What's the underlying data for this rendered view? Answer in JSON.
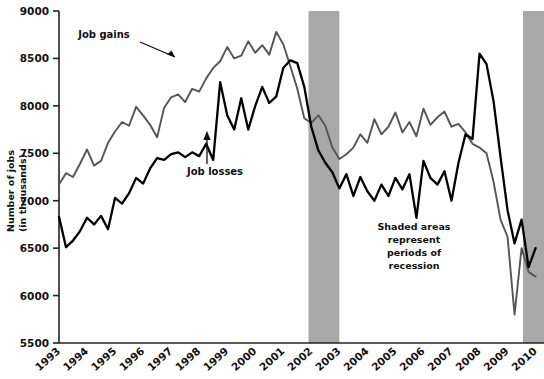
{
  "chart_data": {
    "type": "line",
    "title": "",
    "xlabel": "",
    "ylabel": "Number of jobs\n(in thousands)",
    "ylabel_line1": "Number of jobs",
    "ylabel_line2": "(in thousands)",
    "ylim": [
      5500,
      9000
    ],
    "yticks": [
      5500,
      6000,
      6500,
      7000,
      7500,
      8000,
      8500,
      9000
    ],
    "ytick_labels": [
      "5500",
      "6000",
      "6500",
      "7000",
      "7500",
      "8000",
      "8500",
      "9000"
    ],
    "xlim": [
      1993,
      2010.3
    ],
    "xticks": [
      1993,
      1994,
      1995,
      1996,
      1997,
      1998,
      1999,
      2000,
      2001,
      2002,
      2003,
      2004,
      2005,
      2006,
      2007,
      2008,
      2009,
      2010
    ],
    "xtick_labels": [
      "1993",
      "1994",
      "1995",
      "1996",
      "1997",
      "1998",
      "1999",
      "2000",
      "2001",
      "2002",
      "2003",
      "2004",
      "2005",
      "2006",
      "2007",
      "2008",
      "2009",
      "2010"
    ],
    "grid": false,
    "legend_position": "inline-annotations",
    "series": [
      {
        "name": "Job gains",
        "color": "#555555",
        "label_text": "Job gains",
        "annotation_kind": "arrow-to-line",
        "x": [
          1993.0,
          1993.25,
          1993.5,
          1993.75,
          1994.0,
          1994.25,
          1994.5,
          1994.75,
          1995.0,
          1995.25,
          1995.5,
          1995.75,
          1996.0,
          1996.25,
          1996.5,
          1996.75,
          1997.0,
          1997.25,
          1997.5,
          1997.75,
          1998.0,
          1998.25,
          1998.5,
          1998.75,
          1999.0,
          1999.25,
          1999.5,
          1999.75,
          2000.0,
          2000.25,
          2000.5,
          2000.75,
          2001.0,
          2001.25,
          2001.5,
          2001.75,
          2002.0,
          2002.25,
          2002.5,
          2002.75,
          2003.0,
          2003.25,
          2003.5,
          2003.75,
          2004.0,
          2004.25,
          2004.5,
          2004.75,
          2005.0,
          2005.25,
          2005.5,
          2005.75,
          2006.0,
          2006.25,
          2006.5,
          2006.75,
          2007.0,
          2007.25,
          2007.5,
          2007.75,
          2008.0,
          2008.25,
          2008.5,
          2008.75,
          2009.0,
          2009.25,
          2009.5,
          2009.75,
          2010.0
        ],
        "values": [
          7170,
          7290,
          7250,
          7390,
          7540,
          7370,
          7420,
          7610,
          7730,
          7830,
          7790,
          7990,
          7900,
          7800,
          7670,
          7980,
          8090,
          8120,
          8040,
          8180,
          8150,
          8290,
          8400,
          8470,
          8620,
          8500,
          8530,
          8680,
          8560,
          8640,
          8540,
          8780,
          8650,
          8420,
          8180,
          7870,
          7820,
          7900,
          7790,
          7560,
          7440,
          7490,
          7560,
          7700,
          7610,
          7860,
          7700,
          7780,
          7930,
          7720,
          7830,
          7680,
          7970,
          7800,
          7880,
          7940,
          7780,
          7810,
          7720,
          7600,
          7560,
          7500,
          7200,
          6800,
          6620,
          5800,
          6500,
          6250,
          6200
        ],
        "annotation_description": "Gray line labeled 'Job gains' with arrow pointing to the line near 1995"
      },
      {
        "name": "Job losses",
        "color": "#000000",
        "label_text": "Job losses",
        "annotation_kind": "arrow-to-line",
        "x": [
          1993.0,
          1993.25,
          1993.5,
          1993.75,
          1994.0,
          1994.25,
          1994.5,
          1994.75,
          1995.0,
          1995.25,
          1995.5,
          1995.75,
          1996.0,
          1996.25,
          1996.5,
          1996.75,
          1997.0,
          1997.25,
          1997.5,
          1997.75,
          1998.0,
          1998.25,
          1998.5,
          1998.75,
          1999.0,
          1999.25,
          1999.5,
          1999.75,
          2000.0,
          2000.25,
          2000.5,
          2000.75,
          2001.0,
          2001.25,
          2001.5,
          2001.75,
          2002.0,
          2002.25,
          2002.5,
          2002.75,
          2003.0,
          2003.25,
          2003.5,
          2003.75,
          2004.0,
          2004.25,
          2004.5,
          2004.75,
          2005.0,
          2005.25,
          2005.5,
          2005.75,
          2006.0,
          2006.25,
          2006.5,
          2006.75,
          2007.0,
          2007.25,
          2007.5,
          2007.75,
          2008.0,
          2008.25,
          2008.5,
          2008.75,
          2009.0,
          2009.25,
          2009.5,
          2009.75,
          2010.0
        ],
        "values": [
          6830,
          6510,
          6580,
          6680,
          6820,
          6750,
          6840,
          6700,
          7030,
          6970,
          7080,
          7240,
          7180,
          7340,
          7450,
          7430,
          7490,
          7510,
          7460,
          7510,
          7470,
          7600,
          7430,
          8250,
          7900,
          7750,
          8080,
          7750,
          8000,
          8200,
          8030,
          8100,
          8400,
          8480,
          8450,
          8200,
          7780,
          7530,
          7400,
          7300,
          7130,
          7280,
          7050,
          7250,
          7100,
          7000,
          7170,
          7050,
          7240,
          7120,
          7280,
          6820,
          7420,
          7240,
          7170,
          7310,
          7000,
          7400,
          7700,
          7650,
          8550,
          8440,
          8050,
          7460,
          6900,
          6550,
          6800,
          6300,
          6500
        ],
        "annotation_description": "Black line labeled 'Job losses' with arrow pointing up to the line near 1997"
      }
    ],
    "shaded_regions": [
      {
        "label": "recession",
        "x_start": 2001.9,
        "x_end": 2003.0,
        "color": "#a8a8a8"
      },
      {
        "label": "recession",
        "x_start": 2009.55,
        "x_end": 2010.3,
        "color": "#a8a8a8"
      }
    ],
    "annotations": [
      {
        "name": "job-gains-label",
        "text": "Job gains",
        "x_px": 104,
        "y_px": 38
      },
      {
        "name": "job-losses-label",
        "text": "Job losses",
        "x_px": 185,
        "y_px": 173
      },
      {
        "name": "recession-note-line1",
        "text": "Shaded areas",
        "x_px": 414,
        "y_px": 228
      },
      {
        "name": "recession-note-line2",
        "text": "represent",
        "x_px": 414,
        "y_px": 241
      },
      {
        "name": "recession-note-line3",
        "text": "periods of",
        "x_px": 414,
        "y_px": 254
      },
      {
        "name": "recession-note-line4",
        "text": "recession",
        "x_px": 414,
        "y_px": 267
      }
    ],
    "note_text_full": "Shaded areas represent periods of recession"
  }
}
